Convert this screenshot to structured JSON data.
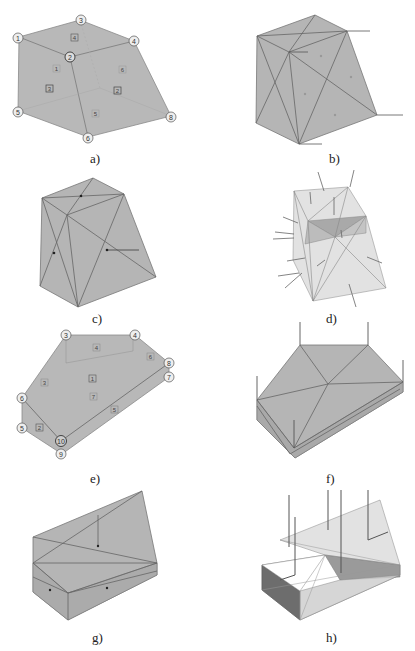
{
  "figure": {
    "background": "#ffffff",
    "face_color": "#b5b5b5",
    "edge_color": "#6e6e6e",
    "panels": [
      {
        "id": "a",
        "caption": "a)",
        "description": "Hexahedral block with numbered nodes and faces",
        "nodes": [
          "1",
          "2",
          "3",
          "4",
          "5",
          "6",
          "8"
        ],
        "faces": [
          "1",
          "2",
          "3",
          "4",
          "5",
          "6"
        ]
      },
      {
        "id": "b",
        "caption": "b)",
        "description": "Triangulated block with normal/force vectors at nodes"
      },
      {
        "id": "c",
        "caption": "c)",
        "description": "Triangulated block with single vector"
      },
      {
        "id": "d",
        "caption": "d)",
        "description": "Transparent block with face normal arrows"
      },
      {
        "id": "e",
        "caption": "e)",
        "description": "Prismatic block with numbered nodes and faces",
        "nodes": [
          "3",
          "4",
          "5",
          "6",
          "7",
          "8",
          "9",
          "10"
        ],
        "faces": [
          "1",
          "2",
          "3",
          "4",
          "5",
          "6",
          "7"
        ]
      },
      {
        "id": "f",
        "caption": "f)",
        "description": "Triangulated prismatic block with vertical vectors"
      },
      {
        "id": "g",
        "caption": "g)",
        "description": "Triangulated prismatic block"
      },
      {
        "id": "h",
        "caption": "h)",
        "description": "Transparent shaded block with vertical vectors"
      }
    ]
  }
}
